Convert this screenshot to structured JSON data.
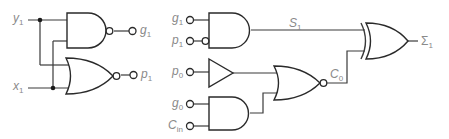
{
  "diagram": {
    "colors": {
      "wire": "#3a3a3a",
      "label": "#8a8a8a",
      "background": "#ffffff"
    },
    "left_block": {
      "inputs": [
        {
          "name": "y",
          "sub": "1"
        },
        {
          "name": "x",
          "sub": "1"
        }
      ],
      "gates": [
        {
          "type": "NAND",
          "output_inverted": true,
          "output": {
            "name": "g",
            "sub": "1"
          }
        },
        {
          "type": "NOR",
          "output_inverted": true,
          "output": {
            "name": "p",
            "sub": "1"
          }
        }
      ]
    },
    "right_block": {
      "inputs": [
        {
          "name": "g",
          "sub": "1"
        },
        {
          "name": "p",
          "sub": "1",
          "inverted": true
        },
        {
          "name": "p",
          "sub": "0"
        },
        {
          "name": "g",
          "sub": "0"
        },
        {
          "name": "C",
          "sub": "in"
        }
      ],
      "gates": [
        {
          "type": "AND",
          "inputs": [
            "g1",
            "p1 (inverted)"
          ],
          "output": "S1"
        },
        {
          "type": "BUFFER",
          "inputs": [
            "p0"
          ]
        },
        {
          "type": "AND",
          "inputs": [
            "g0",
            "Cin"
          ]
        },
        {
          "type": "NOR",
          "inputs": [
            "buffer",
            "AND(g0,Cin)"
          ],
          "output": "C0"
        },
        {
          "type": "XOR",
          "inputs": [
            "S1",
            "C0"
          ],
          "output": "Σ1"
        }
      ],
      "signals": [
        {
          "name": "S",
          "sub": "1"
        },
        {
          "name": "C",
          "sub": "0"
        }
      ],
      "output": {
        "name": "Σ",
        "sub": "1"
      }
    }
  }
}
